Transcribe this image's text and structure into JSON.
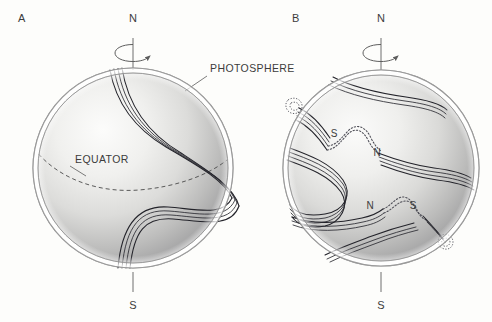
{
  "figure": {
    "type": "diagram",
    "background_color": "#fdfdfb",
    "line_color": "#23232a",
    "shading_color_light": "#fbfbfa",
    "shading_color_dark": "#8e8e92",
    "width": 492,
    "height": 322
  },
  "panels": [
    {
      "id": "A",
      "letter": "A",
      "letter_x": 22,
      "letter_y": 22,
      "sphere": {
        "cx": 133,
        "cy": 168,
        "r": 100,
        "shell_gap": 5
      },
      "north_pole_label": "N",
      "south_pole_label": "S",
      "axis_top_y": 38,
      "axis_bottom_y": 300,
      "rotation_arrow": "counterclockwise-about-axis",
      "callouts": [
        {
          "name": "photosphere",
          "text": "PHOTOSPHERE",
          "x": 210,
          "y": 72
        },
        {
          "name": "equator",
          "text": "EQUATOR",
          "x": 75,
          "y": 163
        }
      ],
      "equator_visible": true,
      "field_line_count": 4,
      "field_description": "single toroidal flux bundle stretched into an S shape by differential rotation, running from the north polar region, bulging east across the equator, and returning toward the south pole"
    },
    {
      "id": "B",
      "letter": "B",
      "letter_x": 296,
      "letter_y": 22,
      "sphere": {
        "cx": 381,
        "cy": 168,
        "r": 98,
        "shell_gap": 5
      },
      "north_pole_label": "N",
      "south_pole_label": "S",
      "axis_top_y": 38,
      "axis_bottom_y": 300,
      "rotation_arrow": "counterclockwise-about-axis",
      "callouts": [],
      "equator_visible": false,
      "field_line_count": 4,
      "field_description": "further wound flux bundles that have become buoyant and erupted through the photosphere, forming two bipolar sunspot pairs with mirror-image polarity on either side of the equator",
      "sunspot_pairs": [
        {
          "name": "northern-bipolar-pair",
          "leading_polarity": "S",
          "trailing_polarity": "N",
          "leading_label": {
            "text": "S",
            "x": 334,
            "y": 137
          },
          "trailing_label": {
            "text": "N",
            "x": 377,
            "y": 156
          },
          "erupted_loop": "dotted arc above the surface between the two spots"
        },
        {
          "name": "southern-bipolar-pair",
          "leading_polarity": "N",
          "trailing_polarity": "S",
          "leading_label": {
            "text": "N",
            "x": 370,
            "y": 209
          },
          "trailing_label": {
            "text": "S",
            "x": 413,
            "y": 209
          },
          "erupted_loop": "dotted arc above the surface between the two spots"
        }
      ],
      "limb_emergence_points": [
        {
          "name": "upper-left-limb-kink",
          "x": 293,
          "y": 105
        },
        {
          "name": "lower-right-limb-kink",
          "x": 444,
          "y": 241
        }
      ]
    }
  ],
  "labels": {
    "photosphere": "PHOTOSPHERE",
    "equator": "EQUATOR",
    "north": "N",
    "south": "S",
    "panel_a": "A",
    "panel_b": "B",
    "polarity_n": "N",
    "polarity_s": "S"
  }
}
